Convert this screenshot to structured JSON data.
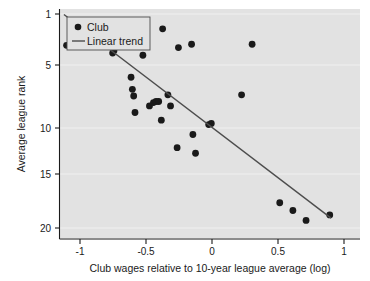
{
  "chart_data": {
    "type": "scatter",
    "title": "",
    "xlabel": "Club wages relative to 10-year league average (log)",
    "ylabel": "Average league rank",
    "xlim": [
      -1.2,
      1.08
    ],
    "ylim": [
      21.2,
      0.4
    ],
    "y_inverted": true,
    "xticks": [
      -1,
      -0.5,
      0,
      0.5,
      1
    ],
    "xtick_labels": [
      "-1",
      "-0.5",
      "0",
      "0.5",
      "1"
    ],
    "yticks": [
      1,
      5,
      10,
      15,
      20
    ],
    "ytick_labels": [
      "1",
      "5",
      "10",
      "15",
      "20"
    ],
    "grid": "horizontal",
    "plot_background": "#e2e2e2",
    "point_color": "#1a1a1a",
    "trend_color": "#4d4d4d",
    "legend": {
      "position": "top-left",
      "entries": [
        {
          "label": "Club",
          "marker": "circle",
          "color": "#1a1a1a"
        },
        {
          "label": "Linear trend",
          "marker": "line",
          "color": "#4d4d4d"
        }
      ]
    },
    "series": [
      {
        "name": "Club",
        "marker": "circle",
        "points": [
          {
            "x": -1.15,
            "y": 17.9
          },
          {
            "x": -1.09,
            "y": 19.0
          },
          {
            "x": -1.03,
            "y": 20.1
          },
          {
            "x": -0.89,
            "y": 19.3
          },
          {
            "x": -0.8,
            "y": 17.2
          },
          {
            "x": -0.79,
            "y": 17.4
          },
          {
            "x": -0.78,
            "y": 18.0
          },
          {
            "x": -0.73,
            "y": 20.0
          },
          {
            "x": -0.69,
            "y": 19.2
          },
          {
            "x": -0.66,
            "y": 15.0
          },
          {
            "x": -0.65,
            "y": 13.9
          },
          {
            "x": -0.64,
            "y": 13.3
          },
          {
            "x": -0.63,
            "y": 11.8
          },
          {
            "x": -0.57,
            "y": 17.0
          },
          {
            "x": -0.55,
            "y": 17.9
          },
          {
            "x": -0.52,
            "y": 12.4
          },
          {
            "x": -0.49,
            "y": 12.7
          },
          {
            "x": -0.47,
            "y": 12.8
          },
          {
            "x": -0.45,
            "y": 12.8
          },
          {
            "x": -0.43,
            "y": 11.1
          },
          {
            "x": -0.42,
            "y": 19.4
          },
          {
            "x": -0.38,
            "y": 13.4
          },
          {
            "x": -0.36,
            "y": 12.4
          },
          {
            "x": -0.31,
            "y": 8.6
          },
          {
            "x": -0.3,
            "y": 17.7
          },
          {
            "x": -0.2,
            "y": 18.0
          },
          {
            "x": -0.19,
            "y": 9.8
          },
          {
            "x": -0.17,
            "y": 8.1
          },
          {
            "x": -0.07,
            "y": 10.7
          },
          {
            "x": -0.05,
            "y": 10.8
          },
          {
            "x": 0.18,
            "y": 13.4
          },
          {
            "x": 0.26,
            "y": 18.0
          },
          {
            "x": 0.47,
            "y": 3.6
          },
          {
            "x": 0.57,
            "y": 2.9
          },
          {
            "x": 0.67,
            "y": 2.0
          },
          {
            "x": 0.85,
            "y": 2.5
          }
        ]
      }
    ],
    "trendline": {
      "name": "Linear trend",
      "x_start": -1.17,
      "y_start": 20.7,
      "x_end": 0.86,
      "y_end": 2.2
    }
  }
}
